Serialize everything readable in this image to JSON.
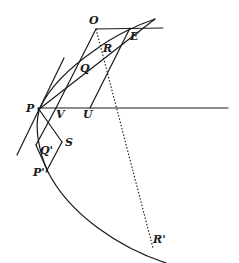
{
  "diagram": {
    "stroke_color": "#1a1a1a",
    "background": "#ffffff",
    "labels": {
      "O": "O",
      "E": "E",
      "R": "R",
      "Q": "Q",
      "P": "P",
      "V": "V",
      "U": "U",
      "S": "S",
      "Q_prime": "Q'",
      "P_prime": "P'",
      "R_prime": "R'"
    }
  }
}
